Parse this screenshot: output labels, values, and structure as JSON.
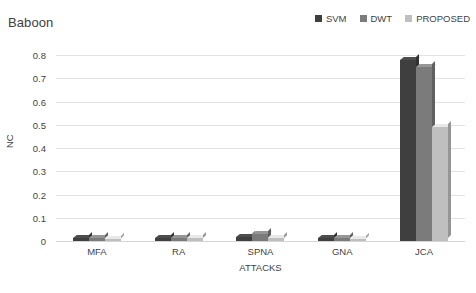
{
  "chart_data": {
    "type": "bar",
    "title": "Baboon",
    "xlabel": "ATTACKS",
    "ylabel": "NC",
    "categories": [
      "MFA",
      "RA",
      "SPNA",
      "GNA",
      "JCA"
    ],
    "series": [
      {
        "name": "SVM",
        "color": "#3f3f3f",
        "values": [
          0.012,
          0.013,
          0.018,
          0.012,
          0.78
        ]
      },
      {
        "name": "DWT",
        "color": "#7b7b7b",
        "values": [
          0.012,
          0.013,
          0.03,
          0.012,
          0.75
        ]
      },
      {
        "name": "PROPOSED",
        "color": "#bfbfbf",
        "values": [
          0.01,
          0.011,
          0.014,
          0.01,
          0.49
        ]
      }
    ],
    "ylim": [
      0,
      0.8
    ],
    "yticks": [
      "0.8",
      "0.7",
      "0.6",
      "0.5",
      "0.4",
      "0.3",
      "0.2",
      "0.1",
      "0"
    ],
    "ytick_values": [
      0.8,
      0.7,
      0.6,
      0.5,
      0.4,
      0.3,
      0.2,
      0.1,
      0
    ],
    "grid": true,
    "legend_position": "top-right"
  }
}
